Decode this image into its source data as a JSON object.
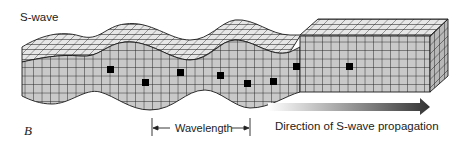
{
  "labels": {
    "wave_type": "S-wave",
    "figure_letter": "B",
    "wavelength": "Wavelength",
    "direction": "Direction of S-wave propagation"
  },
  "colors": {
    "grid_face": "#c8c8c8",
    "grid_top": "#e4e4e4",
    "grid_line": "#1a1a1a",
    "marker": "#000000",
    "arrow_start": "#ffffff",
    "arrow_end": "#3a3a3a"
  },
  "diagram": {
    "marked_particles": 8
  }
}
